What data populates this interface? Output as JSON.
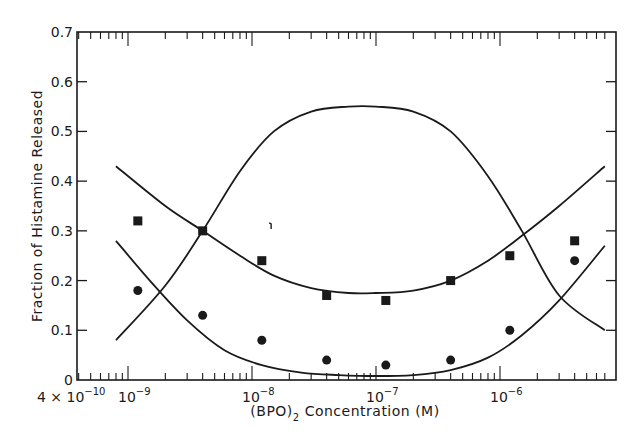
{
  "chart_data": {
    "type": "scatter",
    "title": "",
    "xlabel": "(BPO)2 Concentration (M)",
    "xlabel_parts": {
      "main": "(BPO)",
      "sub": "2",
      "rest": " Concentration (M)"
    },
    "ylabel": "Fraction of Histamine Released",
    "xscale": "log",
    "xlim": [
      4e-10,
      7e-06
    ],
    "ylim": [
      0,
      0.7
    ],
    "grid": false,
    "legend": null,
    "y_ticks": [
      {
        "value": 0,
        "label": "0"
      },
      {
        "value": 0.1,
        "label": "0.1"
      },
      {
        "value": 0.2,
        "label": "0.2"
      },
      {
        "value": 0.3,
        "label": "0.3"
      },
      {
        "value": 0.4,
        "label": "0.4"
      },
      {
        "value": 0.5,
        "label": "0.5"
      },
      {
        "value": 0.6,
        "label": "0.6"
      },
      {
        "value": 0.7,
        "label": "0.7"
      }
    ],
    "x_ticks": [
      {
        "value": 4e-10,
        "label_base": "4 × 10",
        "label_exp": "−10"
      },
      {
        "value": 1e-09,
        "label_base": "10",
        "label_exp": "−9"
      },
      {
        "value": 1e-08,
        "label_base": "10",
        "label_exp": "−8"
      },
      {
        "value": 1e-07,
        "label_base": "10",
        "label_exp": "−7"
      },
      {
        "value": 1e-06,
        "label_base": "10",
        "label_exp": "−6"
      }
    ],
    "series": [
      {
        "name": "squares",
        "marker": "square",
        "x": [
          1.2e-09,
          4e-09,
          1.2e-08,
          4e-08,
          1.2e-07,
          4e-07,
          1.2e-06,
          4e-06
        ],
        "y": [
          0.32,
          0.3,
          0.24,
          0.17,
          0.16,
          0.2,
          0.25,
          0.28
        ]
      },
      {
        "name": "circles",
        "marker": "circle",
        "x": [
          1.2e-09,
          4e-09,
          1.2e-08,
          4e-08,
          1.2e-07,
          4e-07,
          1.2e-06,
          4e-06
        ],
        "y": [
          0.18,
          0.13,
          0.08,
          0.04,
          0.03,
          0.04,
          0.1,
          0.24
        ]
      }
    ],
    "curves": [
      {
        "name": "bell-curve",
        "x": [
          8e-10,
          2e-09,
          4e-09,
          8e-09,
          1.5e-08,
          3e-08,
          6e-08,
          1e-07,
          2e-07,
          4e-07,
          8e-07,
          1.5e-06,
          3e-06,
          7e-06
        ],
        "y": [
          0.08,
          0.19,
          0.3,
          0.42,
          0.5,
          0.54,
          0.55,
          0.55,
          0.54,
          0.5,
          0.41,
          0.3,
          0.17,
          0.1
        ]
      },
      {
        "name": "upper-u-curve",
        "x": [
          8e-10,
          2e-09,
          4e-09,
          8e-09,
          1.5e-08,
          3e-08,
          6e-08,
          1e-07,
          2e-07,
          4e-07,
          8e-07,
          1.5e-06,
          3e-06,
          7e-06
        ],
        "y": [
          0.43,
          0.35,
          0.3,
          0.25,
          0.21,
          0.185,
          0.175,
          0.175,
          0.18,
          0.2,
          0.24,
          0.29,
          0.35,
          0.43
        ]
      },
      {
        "name": "lower-u-curve",
        "x": [
          8e-10,
          1.5e-09,
          3e-09,
          6e-09,
          1.2e-08,
          2.5e-08,
          5e-08,
          1e-07,
          2e-07,
          4e-07,
          8e-07,
          1.5e-06,
          3e-06,
          7e-06
        ],
        "y": [
          0.28,
          0.2,
          0.12,
          0.06,
          0.03,
          0.015,
          0.01,
          0.008,
          0.01,
          0.02,
          0.045,
          0.09,
          0.16,
          0.27
        ]
      }
    ],
    "annotations": [
      {
        "text": "stray mark",
        "x": 1.4e-08,
        "y": 0.31
      }
    ]
  },
  "colors": {
    "ink": "#1a1a1a",
    "background": "#ffffff"
  }
}
